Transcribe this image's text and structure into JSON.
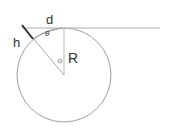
{
  "diagram": {
    "labels": {
      "d": "d",
      "h": "h",
      "R": "R",
      "theta": "θ"
    },
    "colors": {
      "stroke": "#9a9a9a",
      "height_segment": "#333333",
      "text": "#333333",
      "background": "#ffffff"
    }
  }
}
